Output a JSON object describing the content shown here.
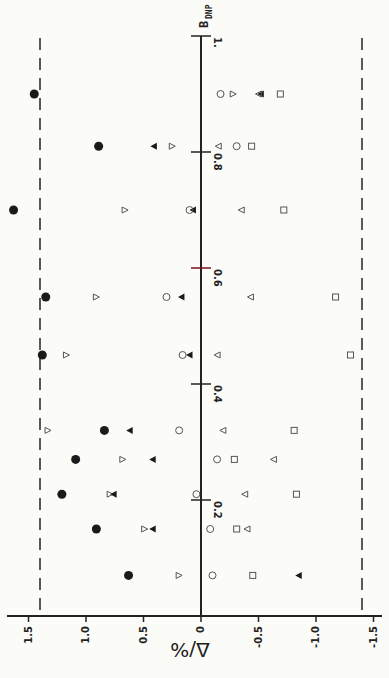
{
  "chart_data": {
    "type": "scatter",
    "orientation": "rotated-90 (B axis vertical, Δ axis horizontal with positive to the left)",
    "title": "",
    "xlabel": "Δ/%",
    "ylabel": "B_DNP",
    "ylabel_main": "B",
    "ylabel_sub": "DNP",
    "x_axis": {
      "label": "Δ/%",
      "range": [
        1.7,
        -1.7
      ],
      "ticks": [
        1.5,
        1.0,
        0.5,
        0,
        -0.5,
        -1.0,
        -1.5
      ],
      "tick_labels": [
        "1.5",
        "1.0",
        "0.5",
        "0",
        "-0.5",
        "-1.0",
        "-1.5"
      ]
    },
    "y_axis": {
      "label": "B_DNP",
      "range": [
        0,
        1.0
      ],
      "ticks": [
        0.2,
        0.4,
        0.6,
        0.8,
        1.0
      ],
      "tick_labels": [
        "0.2",
        "0.4",
        "0.6",
        "0.8",
        "1."
      ]
    },
    "reference_lines": [
      {
        "orientation": "vertical",
        "style": "dashed",
        "delta": 1.4
      },
      {
        "orientation": "vertical",
        "style": "dashed",
        "delta": -1.4
      }
    ],
    "grid": false,
    "legend": "none",
    "series": [
      {
        "name": "filled-circle",
        "marker": "filled-circle",
        "points": [
          [
            0.9,
            1.45
          ],
          [
            0.81,
            0.89
          ],
          [
            0.7,
            1.63
          ],
          [
            0.55,
            1.35
          ],
          [
            0.45,
            1.38
          ],
          [
            0.32,
            0.84
          ],
          [
            0.27,
            1.09
          ],
          [
            0.21,
            1.21
          ],
          [
            0.15,
            0.91
          ],
          [
            0.07,
            0.63
          ]
        ]
      },
      {
        "name": "open-triangle-right",
        "marker": "open-triangle-right",
        "points": [
          [
            0.9,
            -0.28
          ],
          [
            0.81,
            0.25
          ],
          [
            0.7,
            0.66
          ],
          [
            0.55,
            0.91
          ],
          [
            0.45,
            1.17
          ],
          [
            0.32,
            1.33
          ],
          [
            0.27,
            0.68
          ],
          [
            0.21,
            0.79
          ],
          [
            0.15,
            0.49
          ],
          [
            0.07,
            0.19
          ]
        ]
      },
      {
        "name": "filled-triangle-left",
        "marker": "filled-triangle-left",
        "points": [
          [
            0.9,
            -0.52
          ],
          [
            0.81,
            0.41
          ],
          [
            0.7,
            0.07
          ],
          [
            0.55,
            0.17
          ],
          [
            0.45,
            0.1
          ],
          [
            0.32,
            0.62
          ],
          [
            0.27,
            0.42
          ],
          [
            0.21,
            0.76
          ],
          [
            0.15,
            0.42
          ],
          [
            0.07,
            -0.85
          ]
        ]
      },
      {
        "name": "open-circle",
        "marker": "open-circle",
        "points": [
          [
            0.9,
            -0.17
          ],
          [
            0.81,
            -0.31
          ],
          [
            0.7,
            0.1
          ],
          [
            0.55,
            0.3
          ],
          [
            0.45,
            0.16
          ],
          [
            0.32,
            0.19
          ],
          [
            0.27,
            -0.14
          ],
          [
            0.21,
            0.04
          ],
          [
            0.15,
            -0.08
          ],
          [
            0.07,
            -0.1
          ]
        ]
      },
      {
        "name": "open-triangle-left",
        "marker": "open-triangle-left",
        "points": [
          [
            0.9,
            -0.5
          ],
          [
            0.81,
            -0.15
          ],
          [
            0.7,
            -0.35
          ],
          [
            0.55,
            -0.43
          ],
          [
            0.45,
            -0.14
          ],
          [
            0.32,
            -0.19
          ],
          [
            0.27,
            -0.63
          ],
          [
            0.21,
            -0.38
          ],
          [
            0.15,
            -0.4
          ]
        ]
      },
      {
        "name": "open-square",
        "marker": "open-square",
        "points": [
          [
            0.9,
            -0.69
          ],
          [
            0.81,
            -0.44
          ],
          [
            0.7,
            -0.72
          ],
          [
            0.55,
            -1.17
          ],
          [
            0.45,
            -1.3
          ],
          [
            0.32,
            -0.81
          ],
          [
            0.27,
            -0.29
          ],
          [
            0.21,
            -0.83
          ],
          [
            0.15,
            -0.31
          ],
          [
            0.07,
            -0.45
          ]
        ]
      }
    ],
    "annotations": []
  }
}
